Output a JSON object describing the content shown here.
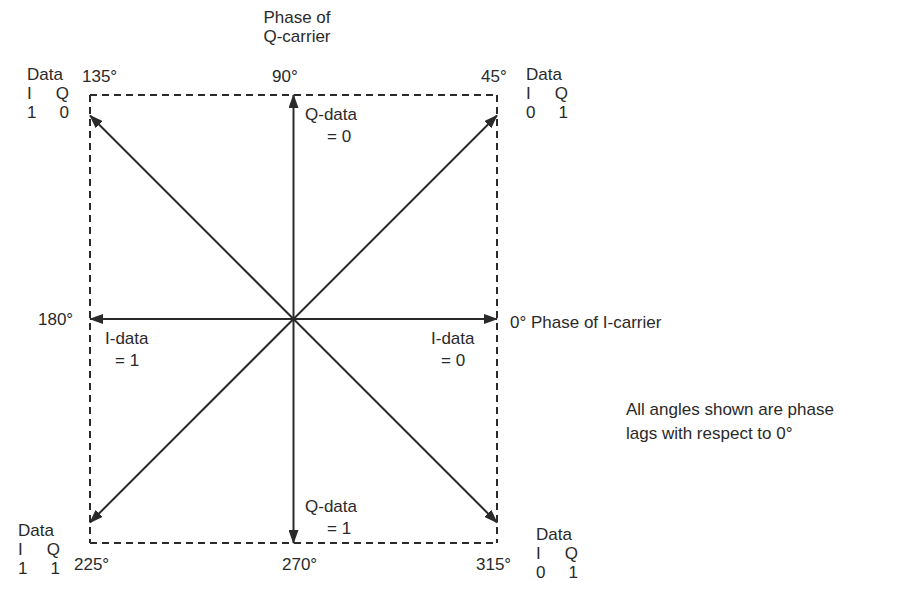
{
  "diagram": {
    "type": "qpsk-phasor-diagram",
    "stroke_color": "#2a2a2a",
    "background": "#ffffff",
    "axis_labels": {
      "q_carrier_line1": "Phase of",
      "q_carrier_line2": "Q-carrier",
      "i_carrier": "0° Phase of I-carrier"
    },
    "angles": {
      "a0": "0°",
      "a45": "45°",
      "a90": "90°",
      "a135": "135°",
      "a180": "180°",
      "a225": "225°",
      "a270": "270°",
      "a315": "315°"
    },
    "data_blocks": [
      {
        "id": "135",
        "title": "Data",
        "i_label": "I",
        "q_label": "Q",
        "i_value": "1",
        "q_value": "0"
      },
      {
        "id": "45",
        "title": "Data",
        "i_label": "I",
        "q_label": "Q",
        "i_value": "0",
        "q_value": "1"
      },
      {
        "id": "225",
        "title": "Data",
        "i_label": "I",
        "q_label": "Q",
        "i_value": "1",
        "q_value": "1"
      },
      {
        "id": "315",
        "title": "Data",
        "i_label": "I",
        "q_label": "Q",
        "i_value": "0",
        "q_value": "1"
      }
    ],
    "axis_data_labels": {
      "q_data_0_line1": "Q-data",
      "q_data_0_line2": "= 0",
      "q_data_1_line1": "Q-data",
      "q_data_1_line2": "= 1",
      "i_data_1_line1": "I-data",
      "i_data_1_line2": "= 1",
      "i_data_0_line1": "I-data",
      "i_data_0_line2": "= 0"
    },
    "note_line1": "All angles shown are phase",
    "note_line2": "lags with respect to 0°",
    "phasors": [
      {
        "name": "phasor-0",
        "angle_deg": 0
      },
      {
        "name": "phasor-45",
        "angle_deg": 45
      },
      {
        "name": "phasor-90",
        "angle_deg": 90
      },
      {
        "name": "phasor-135",
        "angle_deg": 135
      },
      {
        "name": "phasor-180",
        "angle_deg": 180
      },
      {
        "name": "phasor-225",
        "angle_deg": 225
      },
      {
        "name": "phasor-270",
        "angle_deg": 270
      },
      {
        "name": "phasor-315",
        "angle_deg": 315
      }
    ]
  }
}
